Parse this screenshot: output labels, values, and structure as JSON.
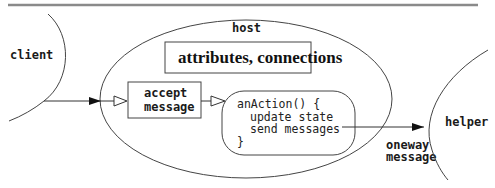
{
  "diagram": {
    "nodes": {
      "client": {
        "label": "client"
      },
      "host": {
        "label": "host"
      },
      "attributes": {
        "label": "attributes, connections"
      },
      "accept": {
        "line1": "accept",
        "line2": "message"
      },
      "action": {
        "lines": [
          "anAction() {",
          "  update state",
          "  send messages",
          "}"
        ]
      },
      "helper": {
        "label": "helper"
      }
    },
    "edges": {
      "oneway": {
        "line1": "oneway",
        "line2": "message"
      }
    },
    "colors": {
      "stroke": "#333333",
      "rule": "#8a8a8a",
      "background": "#ffffff"
    }
  }
}
